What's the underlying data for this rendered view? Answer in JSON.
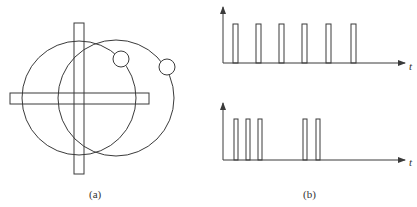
{
  "figure": {
    "panel_a": {
      "label": "(a)",
      "description": "Two overlapping large circles with small circles on their rims, crossed by a vertical and a horizontal bar"
    },
    "panel_b": {
      "label": "(b)",
      "top_plot": {
        "axis_label": "t",
        "pulse_count": 6,
        "pattern": "periodic evenly spaced pulses"
      },
      "bottom_plot": {
        "axis_label": "t",
        "pulse_count": 5,
        "pattern": "group of 3 pulses then group of 2 pulses"
      }
    }
  },
  "colors": {
    "stroke": "#3a3a3a",
    "background": "#ffffff"
  }
}
